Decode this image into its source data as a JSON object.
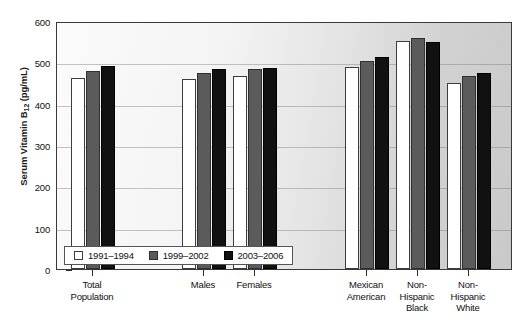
{
  "chart_data": {
    "type": "bar",
    "title": "",
    "subtitle": "",
    "xlabel": "",
    "ylabel": "Serum Vitamin B12 (pg/mL)",
    "ylabel_base": "Serum Vitamin B",
    "ylabel_sub": "12",
    "ylabel_unit": " (pg/mL)",
    "ylim": [
      0,
      600
    ],
    "yticks": [
      0,
      100,
      200,
      300,
      400,
      500,
      600
    ],
    "ytick_labels": [
      "0",
      "100",
      "200",
      "300",
      "400",
      "500",
      "600"
    ],
    "grid": true,
    "grid_axis": "y",
    "legend_position": "bottom-left-inside",
    "categories": [
      "Total Population",
      "Males",
      "Females",
      "Mexican American",
      "Non-Hispanic Black",
      "Non-Hispanic White"
    ],
    "category_lines": [
      [
        "Total",
        "Population"
      ],
      [
        "Males"
      ],
      [
        "Females"
      ],
      [
        "Mexican",
        "American"
      ],
      [
        "Non-",
        "Hispanic",
        "Black"
      ],
      [
        "Non-",
        "Hispanic",
        "White"
      ]
    ],
    "series": [
      {
        "name": "1991–1994",
        "color": "#ffffff",
        "values": [
          462,
          459,
          466,
          489,
          551,
          450
        ]
      },
      {
        "name": "1999–2002",
        "color": "#5b5b5b",
        "values": [
          479,
          475,
          485,
          503,
          560,
          466
        ]
      },
      {
        "name": "2003–2006",
        "color": "#111111",
        "values": [
          490,
          484,
          487,
          513,
          549,
          474
        ]
      }
    ]
  },
  "legend": {
    "items": [
      {
        "label": "1991–1994"
      },
      {
        "label": "1999–2002"
      },
      {
        "label": "2003–2006"
      }
    ]
  }
}
